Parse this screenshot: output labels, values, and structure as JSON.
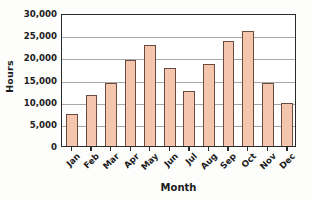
{
  "chart_data": {
    "type": "bar",
    "title": "",
    "xlabel": "Month",
    "ylabel": "Hours",
    "categories": [
      "Jan",
      "Feb",
      "Mar",
      "Apr",
      "May",
      "Jun",
      "Jul",
      "Aug",
      "Sep",
      "Oct",
      "Nov",
      "Dec"
    ],
    "values": [
      7200,
      11500,
      14300,
      19300,
      22700,
      17700,
      12300,
      18400,
      23600,
      26000,
      14200,
      9700
    ],
    "ylim": [
      0,
      30000
    ],
    "ytick_values": [
      0,
      5000,
      10000,
      15000,
      20000,
      25000,
      30000
    ],
    "ytick_labels": [
      "0",
      "5,000",
      "10,000",
      "15,000",
      "20,000",
      "25,000",
      "30,000"
    ],
    "grid": "horizontal",
    "legend": "none",
    "bar_fill_color": "#f6c5ae",
    "bar_edge_color": "#6b4a40",
    "gridline_color": "#a8a8a8",
    "axis_color": "#2a2a2a",
    "background_color": "#fdfdfc",
    "xtick_label_rotation": -45
  }
}
